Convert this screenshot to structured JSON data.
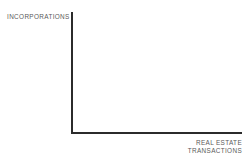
{
  "chart_data": {
    "type": "scatter",
    "title": "",
    "subtitle": "",
    "xlabel": "REAL ESTATE TRANSACTIONS",
    "ylabel": "INCORPORATIONS",
    "xlabel_lines": [
      "REAL ESTATE",
      "TRANSACTIONS"
    ],
    "ylabel_lines": [
      "INCORPORATIONS"
    ],
    "series": [],
    "x": [],
    "values": [],
    "categories": [],
    "xlim": [],
    "ylim": [],
    "xticks": [],
    "yticks": [],
    "xticklabels": [],
    "yticklabels": [],
    "grid": false,
    "legend": false,
    "legend_position": "none",
    "annotations": []
  },
  "figure": {
    "background_color": "#ffffff",
    "axis_color": "#2b2b2b",
    "label_color": "#5a5a5a"
  }
}
